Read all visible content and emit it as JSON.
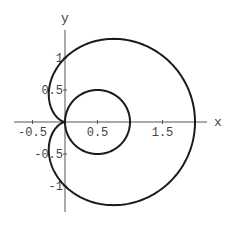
{
  "chart_data": {
    "type": "line",
    "title": "",
    "xlabel": "x",
    "ylabel": "y",
    "xlim": [
      -0.78,
      2.18
    ],
    "ylim": [
      -1.4,
      1.45
    ],
    "grid": false,
    "legend": null,
    "x_ticks": [
      {
        "value": -0.5,
        "label": "-0.5"
      },
      {
        "value": 0.5,
        "label": "0.5"
      },
      {
        "value": 1.5,
        "label": "1.5"
      }
    ],
    "y_ticks": [
      {
        "value": 1,
        "label": "1"
      },
      {
        "value": 0.5,
        "label": "0.5"
      },
      {
        "value": -0.5,
        "label": "-0.5"
      },
      {
        "value": -1,
        "label": "-1"
      }
    ],
    "series": [
      {
        "name": "cardioid",
        "polar": "r = 1 + cos(t)",
        "t_range": [
          0,
          6.2832
        ],
        "color": "#1a1a1a"
      },
      {
        "name": "circle",
        "polar": "r = cos(t)",
        "t_range": [
          0,
          3.1416
        ],
        "color": "#1a1a1a"
      }
    ],
    "key_points": {
      "cardioid_rightmost": [
        2,
        0
      ],
      "cardioid_y_intercepts": [
        1,
        -1
      ],
      "cardioid_cusp": [
        0,
        0
      ],
      "cardioid_leftmost_x": -0.25,
      "cardioid_max_y": 1.3,
      "circle_center": [
        0.5,
        0
      ],
      "circle_radius": 0.5
    }
  },
  "layout": {
    "origin_px": [
      65,
      122
    ],
    "x_scale_px": 65,
    "y_scale_px": 64,
    "x_axis_px": [
      14,
      207
    ],
    "y_axis_px": [
      30,
      212
    ],
    "axis_color": "#555555",
    "curve_color": "#1a1a1a"
  }
}
